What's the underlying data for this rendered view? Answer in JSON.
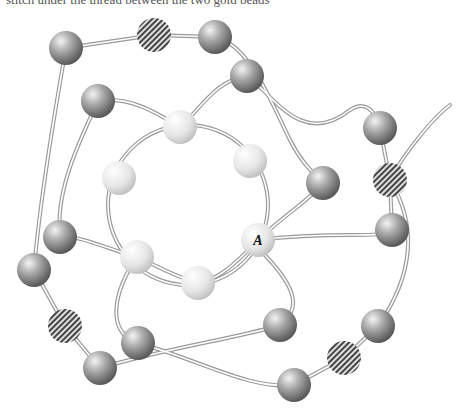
{
  "caption": "stitch under the thread between the two gold beads",
  "figure": {
    "label_a": "A",
    "bead_types": {
      "gray": "gray-bead",
      "hatched": "gold-bead",
      "light": "ring-bead"
    },
    "gray_beads": [
      [
        66,
        48
      ],
      [
        215,
        37
      ],
      [
        247,
        76
      ],
      [
        98,
        101
      ],
      [
        380,
        128
      ],
      [
        323,
        183
      ],
      [
        392,
        230
      ],
      [
        60,
        237
      ],
      [
        34,
        270
      ],
      [
        280,
        325
      ],
      [
        378,
        326
      ],
      [
        138,
        343
      ],
      [
        100,
        368
      ],
      [
        294,
        385
      ]
    ],
    "hatched_beads": [
      [
        154,
        35
      ],
      [
        390,
        180
      ],
      [
        65,
        326
      ],
      [
        344,
        358
      ]
    ],
    "ring_beads": [
      [
        180,
        127
      ],
      [
        250,
        161
      ],
      [
        119,
        178
      ],
      [
        258,
        240
      ],
      [
        137,
        257
      ],
      [
        198,
        283
      ]
    ],
    "colors": {
      "thread": "#9a9a9a",
      "gray": "#8c8c8c",
      "light": "#e8e8e8",
      "hatch": "#444444"
    }
  }
}
